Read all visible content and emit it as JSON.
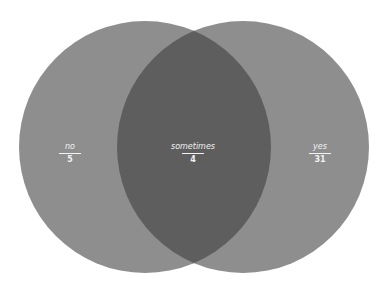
{
  "diagram": {
    "type": "venn",
    "colors": {
      "background": "#ffffff",
      "circle_fill": "#8e8e8e",
      "overlap_fill": "#5e5e5e",
      "label_text": "#f2f2f2"
    },
    "sets": [
      {
        "name": "no",
        "value": "5"
      },
      {
        "name": "yes",
        "value": "31"
      }
    ],
    "overlap": {
      "name": "sometimes",
      "value": "4"
    }
  }
}
